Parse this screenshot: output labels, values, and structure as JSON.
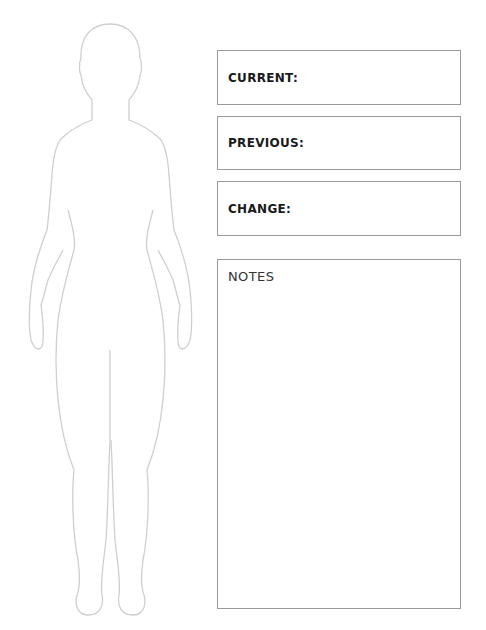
{
  "fields": [
    {
      "label": "CURRENT:",
      "value": ""
    },
    {
      "label": "PREVIOUS:",
      "value": ""
    },
    {
      "label": "CHANGE:",
      "value": ""
    }
  ],
  "notes": {
    "label": "NOTES",
    "value": ""
  },
  "figure": {
    "icon": "body-outline-icon",
    "stroke_color": "#cfcfcf"
  },
  "colors": {
    "border": "#9a9a9a",
    "text": "#1a1a1a"
  }
}
